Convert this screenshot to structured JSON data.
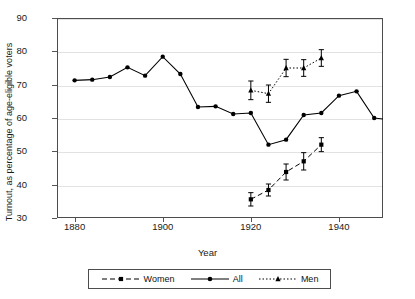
{
  "chart_data": {
    "type": "line",
    "title": "",
    "xlabel": "Year",
    "ylabel": "Turnout, as percentage of age-eligible voters",
    "xlim": [
      1876,
      1950
    ],
    "ylim": [
      30,
      90
    ],
    "xticks": [
      1880,
      1900,
      1920,
      1940
    ],
    "yticks": [
      30,
      40,
      50,
      60,
      70,
      80,
      90
    ],
    "grid": true,
    "legend_position": "bottom-center",
    "series": [
      {
        "name": "Women",
        "marker": "square",
        "linestyle": "dashed",
        "color": "#000000",
        "has_error_bars": true,
        "x": [
          1920,
          1924,
          1928,
          1932,
          1936
        ],
        "y": [
          35.6,
          38.4,
          43.8,
          47.0,
          52.0
        ],
        "yerr": [
          2.0,
          1.8,
          2.4,
          2.6,
          2.1
        ]
      },
      {
        "name": "All",
        "marker": "circle",
        "linestyle": "solid",
        "color": "#000000",
        "has_error_bars": false,
        "x": [
          1880,
          1884,
          1888,
          1892,
          1896,
          1900,
          1904,
          1908,
          1912,
          1916,
          1920,
          1924,
          1928,
          1932,
          1936,
          1940,
          1944,
          1948,
          1952
        ],
        "y": [
          71.3,
          71.5,
          72.3,
          75.2,
          72.7,
          78.4,
          73.2,
          63.3,
          63.5,
          61.2,
          61.5,
          52.0,
          53.5,
          60.9,
          61.5,
          66.7,
          68.0,
          60.0,
          59.4
        ]
      },
      {
        "name": "Men",
        "marker": "triangle",
        "linestyle": "dotted",
        "color": "#000000",
        "has_error_bars": true,
        "x": [
          1920,
          1924,
          1928,
          1932,
          1936
        ],
        "y": [
          68.3,
          67.3,
          75.0,
          75.0,
          78.0
        ],
        "yerr": [
          2.8,
          2.6,
          2.6,
          2.5,
          2.5
        ]
      }
    ]
  },
  "axes": {
    "x_tick_labels": [
      "1880",
      "1900",
      "1920",
      "1940"
    ],
    "y_tick_labels": [
      "30",
      "40",
      "50",
      "60",
      "70",
      "80",
      "90"
    ],
    "x_axis_title": "Year",
    "y_axis_title": "Turnout, as percentage of age-eligible voters"
  },
  "legend": {
    "entries": [
      {
        "label": "Women",
        "marker": "square-marker",
        "line": "dashed-line"
      },
      {
        "label": "All",
        "marker": "circle-marker",
        "line": "solid-line"
      },
      {
        "label": "Men",
        "marker": "triangle-marker",
        "line": "dotted-line"
      }
    ]
  }
}
